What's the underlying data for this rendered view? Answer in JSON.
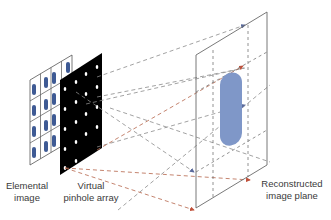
{
  "diagram": {
    "labels": {
      "elemental_image": [
        "Elemental",
        "image"
      ],
      "pinhole_array": [
        "Virtual",
        "pinhole array"
      ],
      "reconstructed_plane": [
        "Reconstructed",
        "image plane"
      ]
    },
    "colors": {
      "grid_line": "#555555",
      "element_blob": "#3e5a94",
      "pinhole_panel": "#000000",
      "pinhole_dot": "#ffffff",
      "ray_gray": "#8a8a8a",
      "ray_red": "#b5654a",
      "plane_outline": "#6a6a6a",
      "reconstructed_blob": "#7f97c8",
      "arrow_blue": "#5a6a9c",
      "arrow_red": "#c0503a"
    },
    "elemental_grid": {
      "rows": 4,
      "cols": 4
    },
    "pinhole_grid": {
      "rows": 5,
      "cols": 4
    }
  }
}
